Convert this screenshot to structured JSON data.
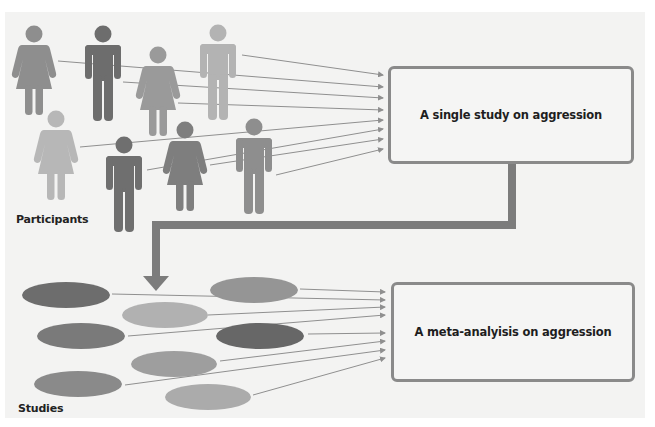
{
  "diagram": {
    "top_section": {
      "label": "Participants",
      "target_box": "A single study on aggression",
      "participants": [
        {
          "type": "female",
          "shade": "medium"
        },
        {
          "type": "male",
          "shade": "dark"
        },
        {
          "type": "female",
          "shade": "medium"
        },
        {
          "type": "male",
          "shade": "light"
        },
        {
          "type": "female",
          "shade": "light"
        },
        {
          "type": "male",
          "shade": "dark"
        },
        {
          "type": "female",
          "shade": "dark"
        },
        {
          "type": "male",
          "shade": "medium"
        }
      ]
    },
    "bottom_section": {
      "label": "Studies",
      "target_box": "A meta-analyisis on aggression",
      "studies_count": 8
    },
    "connector": "arrow from single study box down to studies group",
    "colors": {
      "dark": "#6d6d6d",
      "medium": "#8e8e8e",
      "light": "#b3b3b3",
      "box_border": "#8a8a8a",
      "connector": "#7c7c7c",
      "arrow_line": "#8f8f8f",
      "panel_bg": "#f3f3f2"
    }
  }
}
